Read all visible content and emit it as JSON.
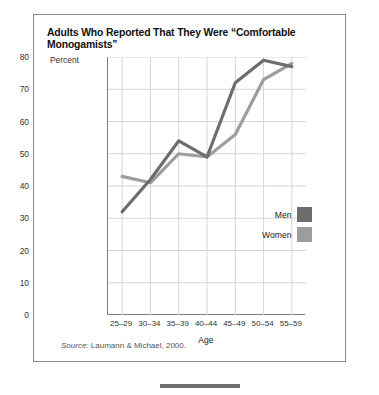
{
  "figure": {
    "title": "Adults Who Reported That They Were “Comfortable Monogamists”",
    "source_prefix": "Source:",
    "source_text": " Laumann & Michael, 2000."
  },
  "legend": {
    "items": [
      {
        "label": "Men",
        "color": "#6d6d6d"
      },
      {
        "label": "Women",
        "color": "#9d9d9d"
      }
    ]
  },
  "chart_data": {
    "type": "line",
    "title": "Adults Who Reported That They Were “Comfortable Monogamists”",
    "xlabel": "Age",
    "ylabel": "Percent",
    "categories": [
      "25–29",
      "30–34",
      "35–39",
      "40–44",
      "45–49",
      "50–54",
      "55–59"
    ],
    "yticks": [
      0,
      10,
      20,
      30,
      40,
      50,
      60,
      70,
      80
    ],
    "ylim": [
      0,
      80
    ],
    "grid": true,
    "legend_position": "inside-right",
    "series": [
      {
        "name": "Men",
        "color": "#6d6d6d",
        "values": [
          32,
          42,
          54,
          49,
          72,
          79,
          77
        ]
      },
      {
        "name": "Women",
        "color": "#9d9d9d",
        "values": [
          43,
          41,
          50,
          49,
          56,
          73,
          78
        ]
      }
    ]
  }
}
